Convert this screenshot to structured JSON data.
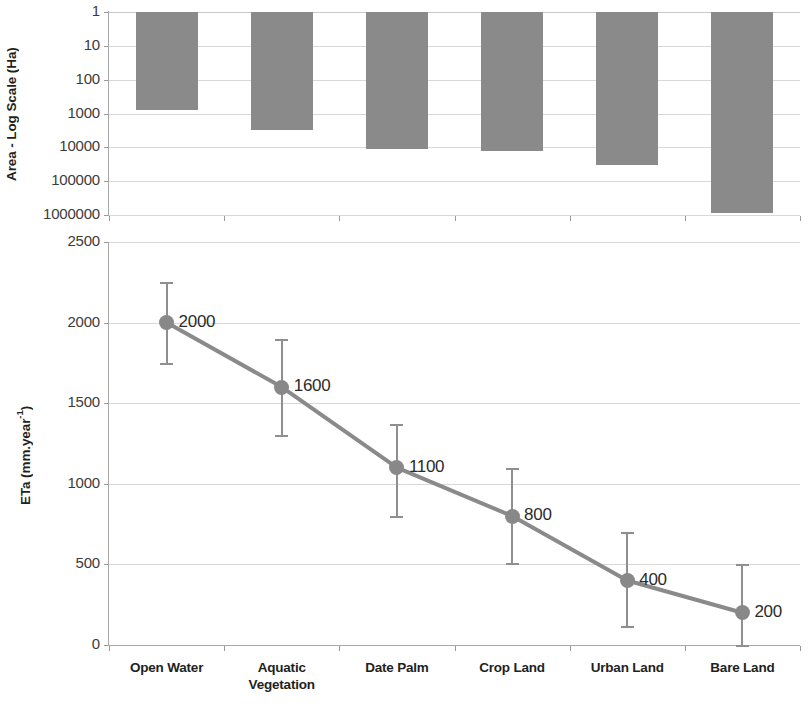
{
  "chart_data": [
    {
      "type": "bar",
      "panel": "top",
      "title": "",
      "ylabel": "Area - Log Scale (Ha)",
      "xlabel": "",
      "yscale": "log",
      "y_inverted": true,
      "ylim": [
        1,
        1000000
      ],
      "yticks": [
        1,
        10,
        100,
        1000,
        10000,
        100000,
        1000000
      ],
      "ytick_labels": [
        "1",
        "10",
        "100",
        "1000",
        "10000",
        "100000",
        "1000000"
      ],
      "grid": true,
      "legend": "none",
      "bar_color": "#8a8a8a",
      "categories": [
        "Open Water",
        "Aquatic Vegetation",
        "Date Palm",
        "Crop Land",
        "Urban Land",
        "Bare Land"
      ],
      "values": [
        800,
        3000,
        11000,
        13000,
        33000,
        900000
      ]
    },
    {
      "type": "line",
      "panel": "bottom",
      "title": "",
      "ylabel": "ETa (mm.year-1)",
      "ylabel_base": "ETa (mm.year",
      "ylabel_sup": "-1",
      "ylabel_tail": ")",
      "xlabel": "",
      "ylim": [
        0,
        2500
      ],
      "yticks": [
        0,
        500,
        1000,
        1500,
        2000,
        2500
      ],
      "ytick_labels": [
        "0",
        "500",
        "1000",
        "1500",
        "2000",
        "2500"
      ],
      "grid": true,
      "legend": "none",
      "line_color": "#8a8a8a",
      "marker_color": "#888888",
      "errorbar_color": "#8f8f8f",
      "categories": [
        "Open Water",
        "Aquatic Vegetation",
        "Date Palm",
        "Crop Land",
        "Urban Land",
        "Bare Land"
      ],
      "values": [
        2000,
        1600,
        1100,
        800,
        400,
        200
      ],
      "data_labels": [
        "2000",
        "1600",
        "1100",
        "800",
        "400",
        "200"
      ],
      "error_low": [
        250,
        300,
        300,
        290,
        280,
        200
      ],
      "error_high": [
        250,
        300,
        270,
        300,
        300,
        300
      ]
    }
  ],
  "top_panel": {
    "ylabel": "Area - Log Scale (Ha)",
    "ytick_labels": [
      "1",
      "10",
      "100",
      "1000",
      "10000",
      "100000",
      "1000000"
    ]
  },
  "bottom_panel": {
    "ylabel_base": "ETa (mm.year",
    "ylabel_sup": "-1",
    "ylabel_tail": ")",
    "ytick_labels": [
      "2500",
      "2000",
      "1500",
      "1000",
      "500",
      "0"
    ],
    "data_labels": [
      "2000",
      "1600",
      "1100",
      "800",
      "400",
      "200"
    ]
  },
  "categories": [
    {
      "line1": "Open Water",
      "line2": ""
    },
    {
      "line1": "Aquatic",
      "line2": "Vegetation"
    },
    {
      "line1": "Date Palm",
      "line2": ""
    },
    {
      "line1": "Crop Land",
      "line2": ""
    },
    {
      "line1": "Urban Land",
      "line2": ""
    },
    {
      "line1": "Bare Land",
      "line2": ""
    }
  ],
  "colors": {
    "bar": "#8a8a8a",
    "line": "#8a8a8a",
    "marker": "#888888",
    "error": "#8f8f8f",
    "grid": "#c9c9c9",
    "axis": "#a8a8a8",
    "text": "#231f20"
  }
}
